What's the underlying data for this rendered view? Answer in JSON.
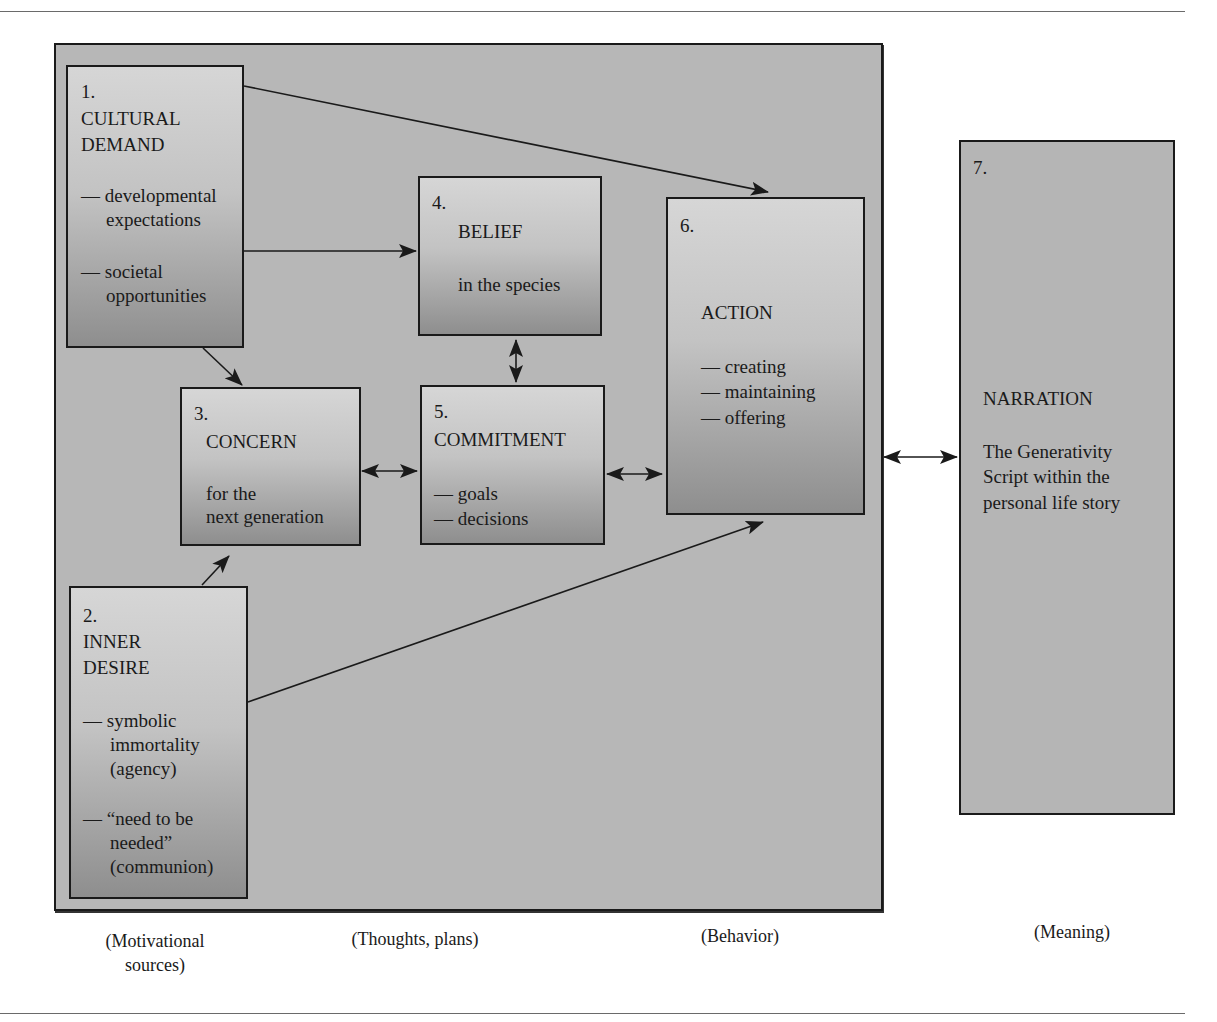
{
  "boxes": {
    "b1": {
      "number": "1.",
      "title_line1": "CULTURAL",
      "title_line2": "DEMAND",
      "item1_line1": "— developmental",
      "item1_line2": "expectations",
      "item2_line1": "— societal",
      "item2_line2": "opportunities"
    },
    "b2": {
      "number": "2.",
      "title_line1": "INNER",
      "title_line2": "DESIRE",
      "item1_line1": "— symbolic",
      "item1_line2": "immortality",
      "item1_line3": "(agency)",
      "item2_line1": "— “need to be",
      "item2_line2": "needed”",
      "item2_line3": "(communion)"
    },
    "b3": {
      "number": "3.",
      "title": "CONCERN",
      "sub_line1": "for the",
      "sub_line2": "next generation"
    },
    "b4": {
      "number": "4.",
      "title": "BELIEF",
      "sub": "in the species"
    },
    "b5": {
      "number": "5.",
      "title": "COMMITMENT",
      "item1": "— goals",
      "item2": "— decisions"
    },
    "b6": {
      "number": "6.",
      "title": "ACTION",
      "item1": "— creating",
      "item2": "— maintaining",
      "item3": "— offering"
    },
    "b7": {
      "number": "7.",
      "title": "NARRATION",
      "sub_line1": "The Generativity",
      "sub_line2": "Script within the",
      "sub_line3": "personal life story"
    }
  },
  "captions": {
    "motivational_line1": "(Motivational",
    "motivational_line2": "sources)",
    "thoughts": "(Thoughts, plans)",
    "behavior": "(Behavior)",
    "meaning": "(Meaning)"
  },
  "colors": {
    "frame_fill": "#b7b7b7",
    "box_light": "#d6d6d6",
    "box_dark": "#8e8e8e",
    "stroke": "#1a1a1a"
  }
}
